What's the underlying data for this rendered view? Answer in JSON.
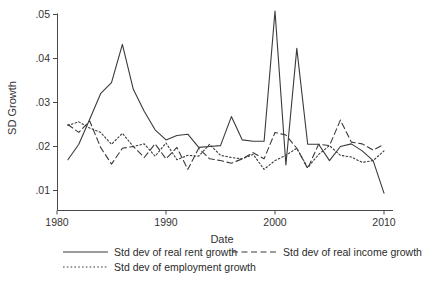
{
  "chart_data": {
    "type": "line",
    "title": "",
    "xlabel": "Date",
    "ylabel": "SD Growth",
    "xlim": [
      1980,
      2010
    ],
    "ylim": [
      0.008,
      0.052
    ],
    "grid": false,
    "legend_position": "bottom",
    "x_ticks": [
      "1980",
      "1990",
      "2000",
      "2010"
    ],
    "x_tick_values": [
      1980,
      1990,
      2000,
      2010
    ],
    "y_ticks": [
      ".01",
      ".02",
      ".03",
      ".04",
      ".05"
    ],
    "y_tick_values": [
      0.01,
      0.02,
      0.03,
      0.04,
      0.05
    ],
    "x": [
      1981,
      1982,
      1983,
      1984,
      1985,
      1986,
      1987,
      1988,
      1989,
      1990,
      1991,
      1992,
      1993,
      1994,
      1995,
      1996,
      1997,
      1998,
      1999,
      2000,
      2001,
      2002,
      2003,
      2004,
      2005,
      2006,
      2007,
      2008,
      2009,
      2010
    ],
    "series": [
      {
        "name": "Std dev of real rent growth",
        "style": "solid",
        "values": [
          0.017,
          0.0205,
          0.0262,
          0.032,
          0.0345,
          0.0432,
          0.033,
          0.028,
          0.0238,
          0.0215,
          0.0225,
          0.0228,
          0.0198,
          0.02,
          0.0202,
          0.0268,
          0.0215,
          0.0212,
          0.0212,
          0.0508,
          0.0158,
          0.0423,
          0.0205,
          0.0205,
          0.0168,
          0.02,
          0.0206,
          0.019,
          0.0168,
          0.0094
        ]
      },
      {
        "name": "Std dev of real income growth",
        "style": "dashed",
        "values": [
          0.025,
          0.0232,
          0.0258,
          0.0198,
          0.016,
          0.0196,
          0.02,
          0.0175,
          0.0206,
          0.0172,
          0.0198,
          0.0148,
          0.0196,
          0.0172,
          0.0168,
          0.0162,
          0.0172,
          0.0186,
          0.0172,
          0.0232,
          0.0226,
          0.0196,
          0.015,
          0.0205,
          0.0202,
          0.026,
          0.021,
          0.0206,
          0.0192,
          0.0205
        ]
      },
      {
        "name": "Std dev of employment growth",
        "style": "dotted",
        "values": [
          0.0248,
          0.0256,
          0.0242,
          0.0232,
          0.0205,
          0.023,
          0.02,
          0.0206,
          0.0178,
          0.0208,
          0.017,
          0.018,
          0.0178,
          0.0205,
          0.018,
          0.0175,
          0.0172,
          0.0182,
          0.0148,
          0.0168,
          0.018,
          0.0196,
          0.0152,
          0.0182,
          0.0202,
          0.018,
          0.0176,
          0.0164,
          0.0168,
          0.019
        ]
      }
    ]
  },
  "legend": {
    "items": [
      {
        "label": "Std dev of real rent growth",
        "style": "solid"
      },
      {
        "label": "Std dev of real income growth",
        "style": "dashed"
      },
      {
        "label": "Std dev of employment growth",
        "style": "dotted"
      }
    ]
  }
}
